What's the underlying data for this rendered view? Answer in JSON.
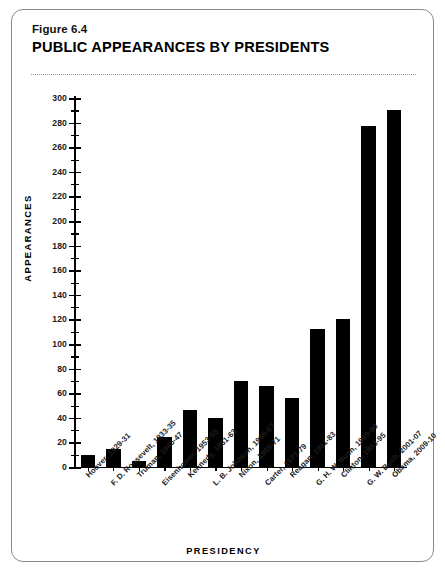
{
  "figure": {
    "number": "Figure 6.4",
    "title": "PUBLIC APPEARANCES BY PRESIDENTS"
  },
  "chart_data": {
    "type": "bar",
    "title": "PUBLIC APPEARANCES BY PRESIDENTS",
    "xlabel": "PRESIDENCY",
    "ylabel": "APPEARANCES",
    "ylim": [
      0,
      300
    ],
    "ytick_step": 20,
    "yminor_step": 10,
    "grid": false,
    "legend": false,
    "bar_color": "#000000",
    "categories": [
      "Hoover, 1929-31",
      "F. D. Roosevelt, 1933-35",
      "Truman, 1945-47",
      "Eisenhower, 1953-55",
      "Kennedy, 1961-63",
      "L. B. Johnson, 1965-67",
      "Nixon, 1969-71",
      "Carter, 1977-79",
      "Reagan, 1981-83",
      "G. H. W. Bush, 1989-90",
      "Clinton, 1993-95",
      "G. W. Bush, 2001-07",
      "Obama, 2009-10"
    ],
    "values": [
      10,
      15,
      5,
      24,
      46,
      40,
      70,
      66,
      56,
      112,
      120,
      277,
      290
    ],
    "ytick_labels": [
      "0",
      "20",
      "40",
      "60",
      "80",
      "100",
      "120",
      "140",
      "160",
      "180",
      "200",
      "220",
      "240",
      "260",
      "280",
      "300"
    ],
    "ytick_values": [
      0,
      20,
      40,
      60,
      80,
      100,
      120,
      140,
      160,
      180,
      200,
      220,
      240,
      260,
      280,
      300
    ]
  }
}
